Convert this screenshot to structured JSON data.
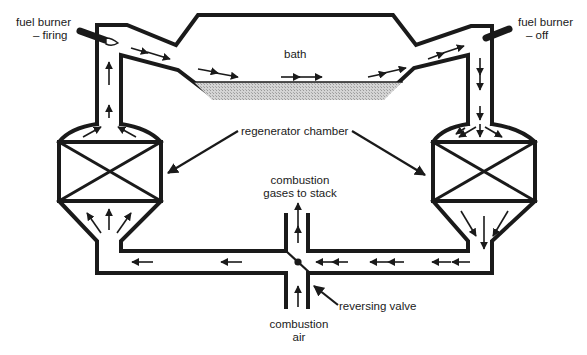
{
  "diagram": {
    "labels": {
      "fuel_burner_left_line1": "fuel burner",
      "fuel_burner_left_line2": "– firing",
      "fuel_burner_right_line1": "fuel burner",
      "fuel_burner_right_line2": "– off",
      "bath": "bath",
      "regenerator_chamber": "regenerator chamber",
      "stack_line1": "combustion",
      "stack_line2": "gases to stack",
      "reversing_valve": "reversing valve",
      "air_line1": "combustion",
      "air_line2": "air"
    },
    "components": [
      {
        "id": "fuel-burner-left",
        "state": "firing"
      },
      {
        "id": "fuel-burner-right",
        "state": "off"
      },
      {
        "id": "bath",
        "fill": "molten (stippled)"
      },
      {
        "id": "regenerator-left",
        "flow": "upward"
      },
      {
        "id": "regenerator-right",
        "flow": "downward"
      },
      {
        "id": "reversing-valve"
      }
    ],
    "flow_direction": "clockwise: air enters, rises through left regenerator, crosses bath left-to-right, descends right regenerator, exits to stack",
    "colors": {
      "line": "#1a1a1a",
      "bath_fill": "#c8c8c8",
      "background": "#ffffff"
    }
  }
}
